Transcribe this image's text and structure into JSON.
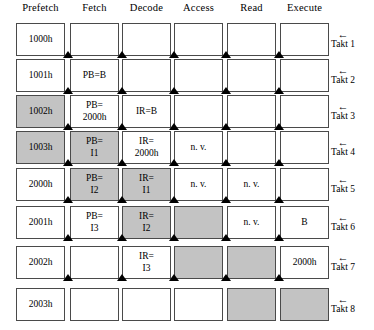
{
  "diagram": {
    "grey_hex": "#c3c3c3",
    "border_hex": "#4a4a4a",
    "arrow_glyph": "←",
    "columns": [
      {
        "name": "prefetch",
        "label": "Prefetch"
      },
      {
        "name": "fetch",
        "label": "Fetch"
      },
      {
        "name": "decode",
        "label": "Decode"
      },
      {
        "name": "access",
        "label": "Access"
      },
      {
        "name": "read",
        "label": "Read"
      },
      {
        "name": "execute",
        "label": "Execute"
      }
    ],
    "rows": [
      {
        "takt_label": "Takt 1",
        "cells": [
          {
            "line1": "1000h",
            "line2": "",
            "shaded": false
          },
          {
            "line1": "",
            "line2": "",
            "shaded": false
          },
          {
            "line1": "",
            "line2": "",
            "shaded": false
          },
          {
            "line1": "",
            "line2": "",
            "shaded": false
          },
          {
            "line1": "",
            "line2": "",
            "shaded": false
          },
          {
            "line1": "",
            "line2": "",
            "shaded": false
          }
        ]
      },
      {
        "takt_label": "Takt 2",
        "cells": [
          {
            "line1": "1001h",
            "line2": "",
            "shaded": false
          },
          {
            "line1": "PB=B",
            "line2": "",
            "shaded": false
          },
          {
            "line1": "",
            "line2": "",
            "shaded": false
          },
          {
            "line1": "",
            "line2": "",
            "shaded": false
          },
          {
            "line1": "",
            "line2": "",
            "shaded": false
          },
          {
            "line1": "",
            "line2": "",
            "shaded": false
          }
        ]
      },
      {
        "takt_label": "Takt 3",
        "cells": [
          {
            "line1": "1002h",
            "line2": "",
            "shaded": true
          },
          {
            "line1": "PB=",
            "line2": "2000h",
            "shaded": false
          },
          {
            "line1": "IR=B",
            "line2": "",
            "shaded": false
          },
          {
            "line1": "",
            "line2": "",
            "shaded": false
          },
          {
            "line1": "",
            "line2": "",
            "shaded": false
          },
          {
            "line1": "",
            "line2": "",
            "shaded": false
          }
        ]
      },
      {
        "takt_label": "Takt 4",
        "cells": [
          {
            "line1": "1003h",
            "line2": "",
            "shaded": true
          },
          {
            "line1": "PB=",
            "line2": "I1",
            "shaded": true
          },
          {
            "line1": "IR=",
            "line2": "2000h",
            "shaded": false
          },
          {
            "line1": "n. v.",
            "line2": "",
            "shaded": false
          },
          {
            "line1": "",
            "line2": "",
            "shaded": false
          },
          {
            "line1": "",
            "line2": "",
            "shaded": false
          }
        ]
      },
      {
        "takt_label": "Takt 5",
        "cells": [
          {
            "line1": "2000h",
            "line2": "",
            "shaded": false
          },
          {
            "line1": "PB=",
            "line2": "I2",
            "shaded": true
          },
          {
            "line1": "IR=",
            "line2": "I1",
            "shaded": true
          },
          {
            "line1": "n. v.",
            "line2": "",
            "shaded": false
          },
          {
            "line1": "n. v.",
            "line2": "",
            "shaded": false
          },
          {
            "line1": "",
            "line2": "",
            "shaded": false
          }
        ]
      },
      {
        "takt_label": "Takt 6",
        "cells": [
          {
            "line1": "2001h",
            "line2": "",
            "shaded": false
          },
          {
            "line1": "PB=",
            "line2": "I3",
            "shaded": false
          },
          {
            "line1": "IR=",
            "line2": "I2",
            "shaded": true
          },
          {
            "line1": "",
            "line2": "",
            "shaded": true
          },
          {
            "line1": "n. v.",
            "line2": "",
            "shaded": false
          },
          {
            "line1": "B",
            "line2": "",
            "shaded": false
          }
        ]
      },
      {
        "takt_label": "Takt 7",
        "cells": [
          {
            "line1": "2002h",
            "line2": "",
            "shaded": false
          },
          {
            "line1": "",
            "line2": "",
            "shaded": false
          },
          {
            "line1": "IR=",
            "line2": "I3",
            "shaded": false
          },
          {
            "line1": "",
            "line2": "",
            "shaded": true
          },
          {
            "line1": "",
            "line2": "",
            "shaded": true
          },
          {
            "line1": "2000h",
            "line2": "",
            "shaded": false
          }
        ]
      },
      {
        "takt_label": "Takt 8",
        "cells": [
          {
            "line1": "2003h",
            "line2": "",
            "shaded": false
          },
          {
            "line1": "",
            "line2": "",
            "shaded": false
          },
          {
            "line1": "",
            "line2": "",
            "shaded": false
          },
          {
            "line1": "",
            "line2": "",
            "shaded": false
          },
          {
            "line1": "",
            "line2": "",
            "shaded": true
          },
          {
            "line1": "",
            "line2": "",
            "shaded": true
          }
        ]
      }
    ]
  }
}
